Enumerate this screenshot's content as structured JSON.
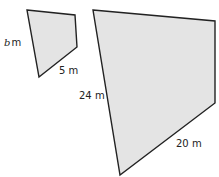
{
  "diagram": {
    "type": "similar-quadrilaterals",
    "colors": {
      "fill": "#e4e4e4",
      "stroke": "#222222",
      "text": "#222222"
    },
    "small_shape": {
      "points": "27,10 75,15 77,47 39,77",
      "labels": {
        "left_side_var": "b",
        "left_side_unit": "m",
        "bottom_side": "5 m"
      }
    },
    "large_shape": {
      "points": "93,10 215,21 215,103 120,175",
      "labels": {
        "left_side": "24 m",
        "bottom_side": "20 m"
      }
    }
  }
}
